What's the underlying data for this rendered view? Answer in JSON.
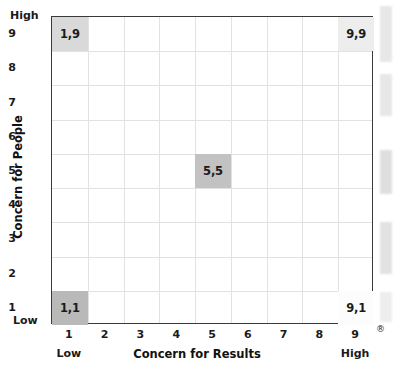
{
  "chart_data": {
    "type": "scatter",
    "title": "",
    "xlabel": "Concern for Results",
    "ylabel": "Concern for People",
    "xlim": [
      0.5,
      9.5
    ],
    "ylim": [
      0.5,
      9.5
    ],
    "grid": true,
    "legend": false,
    "x_ticks": [
      "1",
      "2",
      "3",
      "4",
      "5",
      "6",
      "7",
      "8",
      "9"
    ],
    "y_ticks": [
      "9",
      "8",
      "7",
      "6",
      "5",
      "4",
      "3",
      "2",
      "1"
    ],
    "x_axis_endpoints": {
      "low": "Low",
      "high": "High"
    },
    "y_axis_endpoints": {
      "low": "Low",
      "high": "High"
    },
    "points": [
      {
        "label": "1,9",
        "x": 1,
        "y": 9,
        "fill": "#d9d9d9"
      },
      {
        "label": "9,9",
        "x": 9,
        "y": 9,
        "fill": "#ededed"
      },
      {
        "label": "5,5",
        "x": 5,
        "y": 5,
        "fill": "#c2c2c2"
      },
      {
        "label": "1,1",
        "x": 1,
        "y": 1,
        "fill": "#b9b9b9"
      },
      {
        "label": "9,1",
        "x": 9,
        "y": 1,
        "fill": "#fcfcfc"
      }
    ]
  },
  "axes": {
    "x_title": "Concern for Results",
    "y_title": "Concern for People",
    "y_top_label": "High",
    "y_bottom_label": "Low",
    "x_left_label": "Low",
    "x_right_label": "High",
    "x_ticks": [
      "1",
      "2",
      "3",
      "4",
      "5",
      "6",
      "7",
      "8",
      "9"
    ],
    "y_ticks": [
      "9",
      "8",
      "7",
      "6",
      "5",
      "4",
      "3",
      "2",
      "1"
    ]
  },
  "cells": [
    {
      "label": "1,9"
    },
    {
      "label": "9,9"
    },
    {
      "label": "5,5"
    },
    {
      "label": "1,1"
    },
    {
      "label": "9,1"
    }
  ],
  "marks": {
    "registered": "®"
  },
  "colors": {
    "plot_border": "#3a3a3a",
    "gridline": "#e2e2e2",
    "text": "#1a1a1a",
    "background": "#ffffff"
  }
}
